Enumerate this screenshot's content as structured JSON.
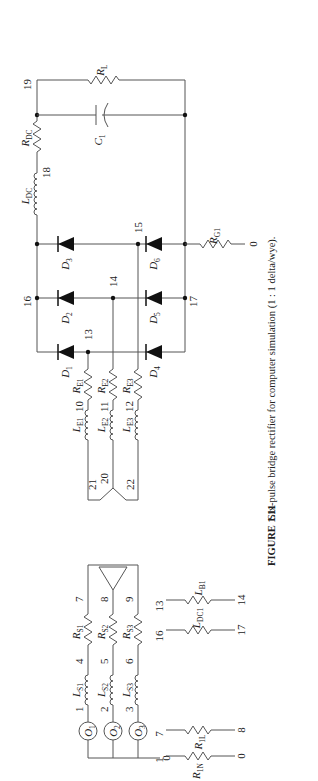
{
  "figure": {
    "number_label": "FIGURE 1.11",
    "caption": "Six-pulse bridge rectifier for computer simulation (1 : 1 delta/wye).",
    "orientation": "rotated 90° counter-clockwise"
  },
  "sources": [
    {
      "label": "O",
      "sub": "1",
      "node": "1"
    },
    {
      "label": "O",
      "sub": "2",
      "node": "2"
    },
    {
      "label": "O",
      "sub": "3",
      "node": "3"
    }
  ],
  "ground_node": "0",
  "source_inductors": [
    {
      "label": "L",
      "sub": "S1",
      "node_out": "4"
    },
    {
      "label": "L",
      "sub": "S2",
      "node_out": "5"
    },
    {
      "label": "L",
      "sub": "S3",
      "node_out": "6"
    }
  ],
  "source_resistors": [
    {
      "label": "R",
      "sub": "S1",
      "node_out": "7"
    },
    {
      "label": "R",
      "sub": "S2",
      "node_out": "8"
    },
    {
      "label": "R",
      "sub": "S3",
      "node_out": "9"
    }
  ],
  "wye_nodes": {
    "a": "21",
    "n": "20",
    "c": "22"
  },
  "secondary_inductors": [
    {
      "label": "L",
      "sub": "E1",
      "node_out": "10"
    },
    {
      "label": "L",
      "sub": "E2",
      "node_out": "11"
    },
    {
      "label": "L",
      "sub": "E3",
      "node_out": "12"
    }
  ],
  "secondary_resistors": [
    {
      "label": "R",
      "sub": "E1"
    },
    {
      "label": "R",
      "sub": "E2"
    },
    {
      "label": "R",
      "sub": "E3"
    }
  ],
  "bridge_nodes": {
    "a": "13",
    "b": "14",
    "c": "15",
    "pos": "16",
    "neg": "17"
  },
  "diodes": [
    {
      "label": "D",
      "sub": "1"
    },
    {
      "label": "D",
      "sub": "2"
    },
    {
      "label": "D",
      "sub": "3"
    },
    {
      "label": "D",
      "sub": "4"
    },
    {
      "label": "D",
      "sub": "5"
    },
    {
      "label": "D",
      "sub": "6"
    }
  ],
  "ground_resistor": {
    "label": "R",
    "sub": "G1",
    "node": "0"
  },
  "dc_link": {
    "inductor": {
      "label": "L",
      "sub": "DC",
      "node_out": "18"
    },
    "resistor": {
      "label": "R",
      "sub": "DC",
      "node_out": "19"
    },
    "capacitor": {
      "label": "C",
      "sub": "1"
    },
    "load": {
      "label": "R",
      "sub": "L"
    }
  },
  "auxiliary_resistors": [
    {
      "from": "1",
      "to": "0",
      "label1": "R",
      "sub1": "1N",
      "label2": "R",
      "sub2": "1L"
    },
    {
      "from": "7",
      "to": "8",
      "label": ""
    },
    {
      "from": "16",
      "to": "17",
      "label": "L",
      "sub": "DC1"
    },
    {
      "from": "13",
      "to": "14",
      "label": "L",
      "sub": "B1"
    }
  ]
}
